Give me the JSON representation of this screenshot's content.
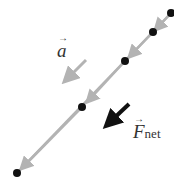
{
  "diagram": {
    "dots": [
      {
        "x": 171,
        "y": 13
      },
      {
        "x": 153,
        "y": 32
      },
      {
        "x": 125,
        "y": 61
      },
      {
        "x": 82,
        "y": 107
      },
      {
        "x": 17,
        "y": 173
      }
    ],
    "labels": {
      "acceleration": "a",
      "net_force": "F",
      "net_force_sub": "net",
      "vector_arrow": "→"
    },
    "colors": {
      "path": "#b3b3b3",
      "dots": "#111111",
      "accel_arrow": "#b3b3b3",
      "force_arrow": "#111111"
    }
  }
}
